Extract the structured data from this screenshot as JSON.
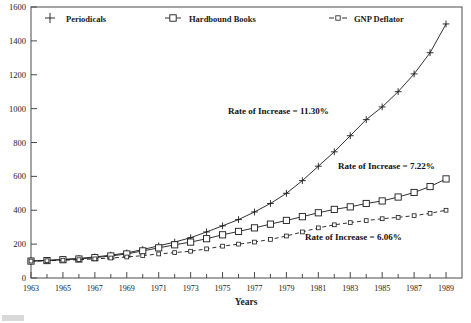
{
  "figure": {
    "background": "#ffffff",
    "ink_color": "#1a1a1a",
    "axis_color": "#4a4a4a"
  },
  "legend": {
    "position": "top-inside-plot",
    "entries": [
      {
        "label": "Periodicals",
        "marker": "plus-icon",
        "line": "solid"
      },
      {
        "label": "Hardbound Books",
        "marker": "square-icon",
        "line": "solid"
      },
      {
        "label": "GNP Deflator",
        "marker": "small-square-icon",
        "line": "dashed"
      }
    ]
  },
  "annotations": [
    {
      "text": "Rate of Increase = 11.30%",
      "series": "Periodicals"
    },
    {
      "text": "Rate of Increase = 7.22%",
      "series": "Hardbound Books"
    },
    {
      "text": "Rate of Increase = 6.06%",
      "series": "GNP Deflator"
    }
  ],
  "chart_data": {
    "type": "line",
    "title": "",
    "subtitle": "",
    "xlabel": "Years",
    "ylabel": "",
    "xlim": [
      1963,
      1990
    ],
    "ylim": [
      0,
      1600
    ],
    "grid": false,
    "legend_position": "top",
    "x_tick_labels": [
      "1963",
      "1965",
      "1967",
      "1969",
      "1971",
      "1973",
      "1975",
      "1977",
      "1979",
      "1981",
      "1983",
      "1985",
      "1987",
      "1989"
    ],
    "x_tick_values": [
      1963,
      1965,
      1967,
      1969,
      1971,
      1973,
      1975,
      1977,
      1979,
      1981,
      1983,
      1985,
      1987,
      1989
    ],
    "x_minor_ticks": [
      1964,
      1966,
      1968,
      1970,
      1972,
      1974,
      1976,
      1978,
      1980,
      1982,
      1984,
      1986,
      1988
    ],
    "y_tick_labels": [
      "0",
      "200",
      "400",
      "600",
      "800",
      "1000",
      "1200",
      "1400",
      "1600"
    ],
    "y_tick_values": [
      0,
      200,
      400,
      600,
      800,
      1000,
      1200,
      1400,
      1600
    ],
    "x": [
      1963,
      1964,
      1965,
      1966,
      1967,
      1968,
      1969,
      1970,
      1971,
      1972,
      1973,
      1974,
      1975,
      1976,
      1977,
      1978,
      1979,
      1980,
      1981,
      1982,
      1983,
      1984,
      1985,
      1986,
      1987,
      1988,
      1989
    ],
    "series": [
      {
        "name": "Periodicals",
        "marker": "plus",
        "line": "solid",
        "annotation": "Rate of Increase = 11.30%",
        "values": [
          100,
          104,
          110,
          116,
          124,
          135,
          148,
          168,
          190,
          212,
          238,
          272,
          308,
          345,
          390,
          440,
          500,
          575,
          660,
          745,
          840,
          935,
          1010,
          1100,
          1205,
          1330,
          1500
        ]
      },
      {
        "name": "Hardbound Books",
        "marker": "square",
        "line": "solid",
        "annotation": "Rate of Increase = 7.22%",
        "values": [
          100,
          103,
          108,
          112,
          120,
          130,
          142,
          160,
          178,
          196,
          212,
          232,
          255,
          275,
          296,
          318,
          340,
          362,
          385,
          405,
          420,
          440,
          455,
          478,
          505,
          540,
          585
        ]
      },
      {
        "name": "GNP Deflator",
        "marker": "small-square",
        "line": "dashed",
        "annotation": "Rate of Increase = 6.06%",
        "values": [
          100,
          102,
          105,
          108,
          113,
          118,
          124,
          132,
          142,
          150,
          158,
          172,
          188,
          200,
          212,
          228,
          248,
          272,
          296,
          314,
          327,
          339,
          350,
          358,
          368,
          382,
          400
        ]
      }
    ]
  }
}
